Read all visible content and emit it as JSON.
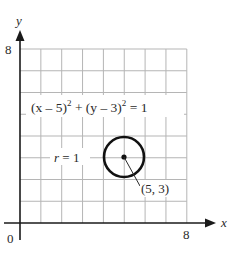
{
  "figure": {
    "type": "coordinate-plane-circle",
    "axes": {
      "x_label": "x",
      "y_label": "y",
      "origin_label": "0",
      "x_max_label": "8",
      "y_max_label": "8",
      "x_range": [
        0,
        8
      ],
      "y_range": [
        0,
        8
      ],
      "grid_step": 1
    },
    "circle": {
      "center": [
        5,
        3
      ],
      "radius": 1,
      "center_label": "(5, 3)",
      "radius_label": "r = 1"
    },
    "equation": {
      "part1": "(x – 5)",
      "exp1": "2",
      "plus": " + (y – 3)",
      "exp2": "2",
      "rhs": " = 1"
    },
    "colors": {
      "grid": "#b5b5b5",
      "axis": "#1a1a1a",
      "circle": "#111111",
      "text": "#2a2a2a"
    }
  }
}
